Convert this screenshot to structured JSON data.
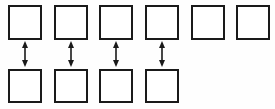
{
  "diagram": {
    "type": "paired-node-diagram",
    "canvas": {
      "width": 275,
      "height": 109,
      "background_color": "#fefefe"
    },
    "style": {
      "box_fill_color": "#ffffff",
      "box_border_color": "#1a1a1a",
      "box_border_width": 2,
      "arrow_color": "#1a1a1a",
      "arrow_line_width": 1.6,
      "arrow_head_width": 6,
      "arrow_head_height": 7
    },
    "rows": [
      {
        "name": "top-row",
        "label": "",
        "y": 5,
        "box_width": 34,
        "box_height": 35,
        "count": 6,
        "boxes": [
          {
            "name": "top-box-1",
            "label": "",
            "x": 8
          },
          {
            "name": "top-box-2",
            "label": "",
            "x": 54
          },
          {
            "name": "top-box-3",
            "label": "",
            "x": 99
          },
          {
            "name": "top-box-4",
            "label": "",
            "x": 145
          },
          {
            "name": "top-box-5",
            "label": "",
            "x": 191
          },
          {
            "name": "top-box-6",
            "label": "",
            "x": 236
          }
        ]
      },
      {
        "name": "bottom-row",
        "label": "",
        "y": 69,
        "box_width": 34,
        "box_height": 34,
        "count": 4,
        "boxes": [
          {
            "name": "bottom-box-1",
            "label": "",
            "x": 8
          },
          {
            "name": "bottom-box-2",
            "label": "",
            "x": 54
          },
          {
            "name": "bottom-box-3",
            "label": "",
            "x": 99
          },
          {
            "name": "bottom-box-4",
            "label": "",
            "x": 145
          }
        ]
      }
    ],
    "connectors": [
      {
        "name": "connector-1",
        "label": "",
        "x": 25,
        "y_start": 41,
        "y_end": 67,
        "double_headed": true
      },
      {
        "name": "connector-2",
        "label": "",
        "x": 71,
        "y_start": 41,
        "y_end": 67,
        "double_headed": true
      },
      {
        "name": "connector-3",
        "label": "",
        "x": 116,
        "y_start": 41,
        "y_end": 67,
        "double_headed": true
      },
      {
        "name": "connector-4",
        "label": "",
        "x": 162,
        "y_start": 41,
        "y_end": 67,
        "double_headed": true
      }
    ],
    "unpaired_top_boxes": [
      "top-box-5",
      "top-box-6"
    ]
  }
}
